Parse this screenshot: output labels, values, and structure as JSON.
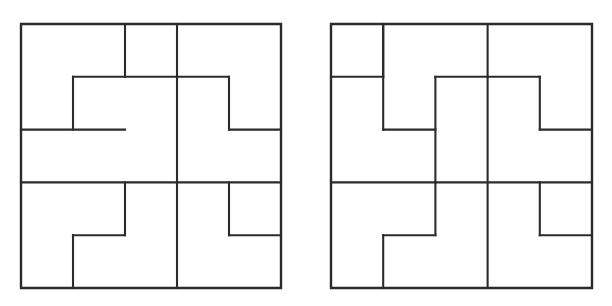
{
  "page": {
    "background_color": "#ffffff",
    "width": 612,
    "height": 306,
    "stroke_color": "#2b2b2b",
    "fill_color": "#ffffff"
  },
  "figures": [
    {
      "id": "left-figure",
      "name": "left-pinwheel-square",
      "label": "",
      "origin": {
        "x": 21,
        "y": 24
      },
      "size": {
        "width": 260,
        "height": 264
      },
      "grid": {
        "cols": 5,
        "rows": 5,
        "cell_width": 52,
        "cell_height": 52.8
      },
      "regions": [
        {
          "name": "region-top-left-L",
          "points": "0,0 2,0 2,1 1,1 1,2 0,2"
        },
        {
          "name": "region-top-mid-rect",
          "points": "2,0 3,0 3,1 2,1"
        },
        {
          "name": "region-top-right-block",
          "points": "3,0 5,0 5,1 5,2 4,2 4,1 3,1"
        },
        {
          "name": "region-center-upper-L",
          "points": "1,1 2,1 3,1 3,2 3,3 2,3 2,2 1,2"
        },
        {
          "name": "region-right-upper-L",
          "points": "3,1 4,1 4,2 5,2 5,3 4,3 3,3 3,2"
        },
        {
          "name": "region-left-mid-rect",
          "points": "0,2 1,2 2,2 2,3 1,3 0,3"
        },
        {
          "name": "region-bottom-left-L",
          "points": "0,3 2,3 2,4 1,4 1,5 0,5"
        },
        {
          "name": "region-bottom-mid-L",
          "points": "1,4 3,4 3,5 1,5"
        },
        {
          "name": "region-bottom-center-L",
          "points": "2,3 3,3 4,3 4,4 3,4 3,5"
        },
        {
          "name": "region-bottom-right-L",
          "points": "3,3 4,3 4,4 5,4 5,5 3,5"
        }
      ],
      "polylines": [
        "0,0 5,0 5,5 0,5 0,0",
        "2,0 2,1",
        "3,0 3,1",
        "1,1 4,1",
        "1,1 1,2",
        "0,2 2,2",
        "3,1 3,5",
        "4,1 4,2",
        "4,2 5,2",
        "0,3 5,3",
        "2,3 2,4",
        "1,4 2,4",
        "1,4 1,5",
        "4,3 4,4",
        "4,4 5,4"
      ]
    },
    {
      "id": "right-figure",
      "name": "right-pinwheel-square",
      "label": "",
      "origin": {
        "x": 331,
        "y": 24
      },
      "size": {
        "width": 261,
        "height": 264
      },
      "grid": {
        "cols": 5,
        "rows": 5,
        "cell_width": 52.2,
        "cell_height": 52.8
      },
      "regions": [
        {
          "name": "region-top-left-rect",
          "points": "0,0 1,0 1,1 0,1"
        },
        {
          "name": "region-top-mid-L",
          "points": "1,0 3,0 3,1 2,1 2,2 1,2"
        },
        {
          "name": "region-top-right-block",
          "points": "3,0 5,0 5,1 5,2 4,2 4,1 3,1"
        },
        {
          "name": "region-left-upper-L",
          "points": "0,1 1,1 1,2 2,2 2,3 0,3"
        },
        {
          "name": "region-center-upper-L",
          "points": "2,1 3,1 4,1 4,2 3,2 3,3 2,3"
        },
        {
          "name": "region-right-mid-L",
          "points": "3,2 4,2 5,2 5,3 4,3 3,3"
        },
        {
          "name": "region-bottom-left-L",
          "points": "0,3 2,3 2,4 1,4 1,5 0,5"
        },
        {
          "name": "region-bottom-mid-L",
          "points": "1,4 3,4 3,5 1,5"
        },
        {
          "name": "region-bottom-center-L",
          "points": "2,3 3,3 3,4 3,5"
        },
        {
          "name": "region-bottom-right-L",
          "points": "3,3 4,3 4,4 5,4 5,5 3,5"
        }
      ],
      "polylines": [
        "0,0 5,0 5,5 0,5 0,0",
        "1,0 1,1",
        "0,1 1,1",
        "1,0 1,2",
        "3,0 3,1",
        "2,1 4,1",
        "2,1 2,3",
        "1,2 2,2",
        "4,1 4,2",
        "3,1 3,5",
        "4,2 5,2",
        "0,3 5,3",
        "2,3 2,4",
        "1,4 2,4",
        "1,4 1,5",
        "4,3 4,4",
        "4,4 5,4"
      ]
    }
  ]
}
